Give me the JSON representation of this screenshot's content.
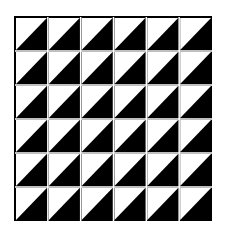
{
  "figure": {
    "type": "triangle-tiling-pattern",
    "rows": 6,
    "cols": 6,
    "cell_fill": {
      "upper_left": "#ffffff",
      "lower_right": "#000000"
    },
    "grid_line_color": "#ffffff"
  }
}
